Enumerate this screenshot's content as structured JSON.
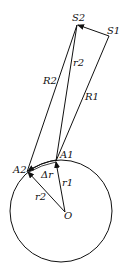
{
  "diagram": {
    "labels": {
      "S1": "S1",
      "S2": "S2",
      "R1": "R1",
      "R2": "R2",
      "tau2": "r2",
      "A1": "A1",
      "A2": "A2",
      "delta_r": "Δr",
      "r1": "r1",
      "r2": "r2",
      "O": "O"
    },
    "points": {
      "S1": [
        109,
        36
      ],
      "S2": [
        77,
        25
      ],
      "A1": [
        56,
        161
      ],
      "A2": [
        27,
        172
      ],
      "O": [
        65,
        212
      ]
    },
    "circle": {
      "cx": 61,
      "cy": 211,
      "r": 51
    },
    "stroke_color": "#111111"
  }
}
